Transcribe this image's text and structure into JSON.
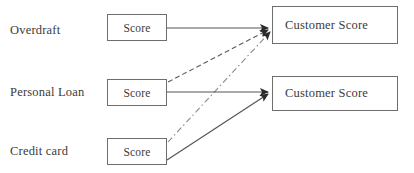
{
  "diagram": {
    "canvas": {
      "width": 414,
      "height": 173
    },
    "colors": {
      "background": "#ffffff",
      "box_border": "#6e6e6e",
      "text": "#3b3b3b",
      "edge_solid": "#555555",
      "edge_dashed": "#5a5a5a",
      "edge_dashdot": "#8a8a8a",
      "arrowhead": "#2b2b2b"
    },
    "rows": [
      {
        "id": "overdraft",
        "label": "Overdraft",
        "label_x": 10,
        "label_y": 23,
        "box_label": "Score",
        "box": {
          "x": 107,
          "y": 14,
          "w": 60,
          "h": 27
        }
      },
      {
        "id": "personal-loan",
        "label": "Personal Loan",
        "label_x": 10,
        "label_y": 85,
        "box_label": "Score",
        "box": {
          "x": 107,
          "y": 79,
          "w": 60,
          "h": 27
        }
      },
      {
        "id": "credit-card",
        "label": "Credit card",
        "label_x": 10,
        "label_y": 144,
        "box_label": "Score",
        "box": {
          "x": 107,
          "y": 138,
          "w": 60,
          "h": 27
        }
      }
    ],
    "targets": [
      {
        "id": "customer-score-top",
        "label": "Customer Score",
        "box": {
          "x": 272,
          "y": 6,
          "w": 126,
          "h": 38
        }
      },
      {
        "id": "customer-score-bottom",
        "label": "Customer Score",
        "box": {
          "x": 272,
          "y": 76,
          "w": 126,
          "h": 35
        }
      }
    ],
    "edges": [
      {
        "id": "overdraft-to-top",
        "from": "overdraft",
        "to": "customer-score-top",
        "style": "solid",
        "x1": 167,
        "y1": 28,
        "x2": 268,
        "y2": 28
      },
      {
        "id": "personal-loan-to-top",
        "from": "personal-loan",
        "to": "customer-score-top",
        "style": "dashed",
        "x1": 168,
        "y1": 82,
        "x2": 268,
        "y2": 30
      },
      {
        "id": "credit-card-to-top",
        "from": "credit-card",
        "to": "customer-score-top",
        "style": "dashdot",
        "x1": 168,
        "y1": 142,
        "x2": 270,
        "y2": 32
      },
      {
        "id": "personal-loan-to-bottom",
        "from": "personal-loan",
        "to": "customer-score-bottom",
        "style": "solid",
        "x1": 167,
        "y1": 92,
        "x2": 268,
        "y2": 92
      },
      {
        "id": "credit-card-to-bottom",
        "from": "credit-card",
        "to": "customer-score-bottom",
        "style": "solid",
        "x1": 167,
        "y1": 160,
        "x2": 268,
        "y2": 94
      }
    ]
  }
}
